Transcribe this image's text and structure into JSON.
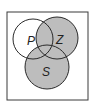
{
  "diagram": {
    "type": "venn",
    "sets": [
      {
        "label": "P",
        "shaded": false
      },
      {
        "label": "Z",
        "shaded": true
      },
      {
        "label": "S",
        "shaded": true
      }
    ],
    "shaded_region": "Z ∪ S",
    "colors": {
      "shade": "#bdbdbd",
      "stroke": "#2a2a2a",
      "background": "#ffffff"
    }
  }
}
